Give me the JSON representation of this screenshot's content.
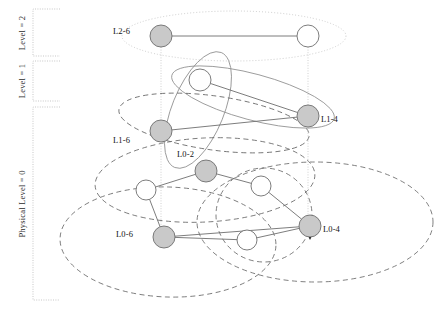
{
  "figure": {
    "background": "#ffffff",
    "axis": {
      "brackets": [
        {
          "name": "level-2",
          "label": "Level = 2",
          "x": 33,
          "y_top": 9,
          "y_bottom": 56,
          "width": 27
        },
        {
          "name": "level-1",
          "label": "Level = 1",
          "x": 33,
          "y_top": 61,
          "y_bottom": 101,
          "width": 27
        },
        {
          "name": "level-0",
          "label": "Physical Level = 0",
          "x": 33,
          "y_top": 107,
          "y_bottom": 300,
          "width": 27
        }
      ],
      "bracket_color": "#b9b9b9",
      "label_color": "#2b2b2b"
    },
    "colors": {
      "filled_node": "#c9c9c9",
      "empty_node": "#ffffff",
      "node_stroke": "#6e6e6e",
      "edge": "#6e6e6e",
      "dotted_cluster": "#c0c0c0",
      "solid_cluster": "#8f8f8f",
      "dashed_cluster": "#5f5f5f",
      "projection_line": "#c4c4c4"
    },
    "nodes": [
      {
        "id": "n-l2-6",
        "label": "L2-6",
        "cx": 161,
        "cy": 36,
        "r": 11,
        "fill": "filled",
        "label_dx": -31,
        "label_dy": -4
      },
      {
        "id": "n-l2-r",
        "label": "",
        "cx": 308,
        "cy": 36,
        "r": 11,
        "fill": "empty",
        "label_dx": 0,
        "label_dy": 0
      },
      {
        "id": "n-l1-w",
        "label": "",
        "cx": 200,
        "cy": 80,
        "r": 11,
        "fill": "empty",
        "label_dx": 0,
        "label_dy": 0
      },
      {
        "id": "n-l1-4",
        "label": "L1-4",
        "cx": 308,
        "cy": 116,
        "r": 11,
        "fill": "filled",
        "label_dx": 13,
        "label_dy": 4
      },
      {
        "id": "n-l1-6",
        "label": "L1-6",
        "cx": 161,
        "cy": 131,
        "r": 11,
        "fill": "filled",
        "label_dx": -31,
        "label_dy": 10
      },
      {
        "id": "n-l0-2",
        "label": "L0-2",
        "cx": 206,
        "cy": 171,
        "r": 11,
        "fill": "filled",
        "label_dx": -12,
        "label_dy": -16
      },
      {
        "id": "n-l0-w1",
        "label": "",
        "cx": 146,
        "cy": 190,
        "r": 10,
        "fill": "empty",
        "label_dx": 0,
        "label_dy": 0
      },
      {
        "id": "n-l0-w2",
        "label": "",
        "cx": 261,
        "cy": 186,
        "r": 10,
        "fill": "empty",
        "label_dx": 0,
        "label_dy": 0
      },
      {
        "id": "n-l0-6",
        "label": "L0-6",
        "cx": 164,
        "cy": 237,
        "r": 11,
        "fill": "filled",
        "label_dx": -31,
        "label_dy": -2
      },
      {
        "id": "n-l0-w3",
        "label": "",
        "cx": 247,
        "cy": 240,
        "r": 10,
        "fill": "empty",
        "label_dx": 0,
        "label_dy": 0
      },
      {
        "id": "n-l0-4",
        "label": "L0-4",
        "cx": 310,
        "cy": 226,
        "r": 11,
        "fill": "filled",
        "label_dx": 13,
        "label_dy": 4
      }
    ],
    "edges": [
      {
        "from": "n-l2-6",
        "to": "n-l2-r"
      },
      {
        "from": "n-l1-w",
        "to": "n-l1-4"
      },
      {
        "from": "n-l1-6",
        "to": "n-l1-4"
      },
      {
        "from": "n-l0-2",
        "to": "n-l0-w2"
      },
      {
        "from": "n-l0-2",
        "to": "n-l0-w1"
      },
      {
        "from": "n-l0-w1",
        "to": "n-l0-6"
      },
      {
        "from": "n-l0-6",
        "to": "n-l0-w3"
      },
      {
        "from": "n-l0-6",
        "to": "n-l0-4"
      },
      {
        "from": "n-l0-w3",
        "to": "n-l0-4"
      },
      {
        "from": "n-l0-w2",
        "to": "n-l0-4"
      }
    ],
    "projections": [
      {
        "name": "projection-left",
        "x": 161,
        "y_top": 47,
        "y_bottom": 227
      },
      {
        "name": "projection-right",
        "x": 308,
        "y_top": 47,
        "y_bottom": 216
      }
    ],
    "arrow": {
      "name": "arrow-to-l0-4",
      "x": 310,
      "y": 240
    },
    "clusters": [
      {
        "name": "cluster-level2",
        "cx": 234,
        "cy": 36,
        "rx": 112,
        "ry": 25,
        "rot": 0,
        "style": "dotted"
      },
      {
        "name": "cluster-level1-a",
        "cx": 253,
        "cy": 97,
        "rx": 84,
        "ry": 23,
        "rot": 15,
        "style": "solid"
      },
      {
        "name": "cluster-level1-b",
        "cx": 198,
        "cy": 110,
        "rx": 62,
        "ry": 26,
        "rot": -68,
        "style": "solid"
      },
      {
        "name": "cluster-level1-c",
        "cx": 214,
        "cy": 123,
        "rx": 96,
        "ry": 27,
        "rot": 8,
        "style": "dashed"
      },
      {
        "name": "cluster-level0-a",
        "cx": 205,
        "cy": 180,
        "rx": 110,
        "ry": 42,
        "rot": -3,
        "style": "dashed"
      },
      {
        "name": "cluster-level0-b",
        "cx": 168,
        "cy": 242,
        "rx": 108,
        "ry": 55,
        "rot": 2,
        "style": "dashed"
      },
      {
        "name": "cluster-level0-c",
        "cx": 315,
        "cy": 222,
        "rx": 118,
        "ry": 60,
        "rot": 0,
        "style": "dashed"
      },
      {
        "name": "cluster-level0-d",
        "cx": 264,
        "cy": 215,
        "rx": 48,
        "ry": 47,
        "rot": 0,
        "style": "dashed"
      }
    ]
  }
}
